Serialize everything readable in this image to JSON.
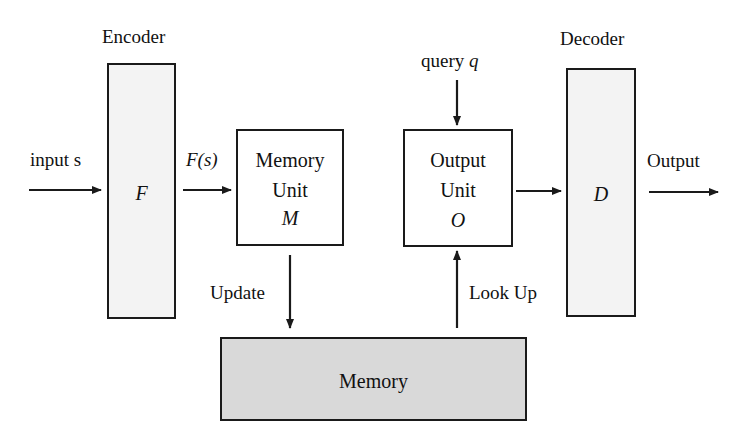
{
  "diagram": {
    "encoder": {
      "title": "Encoder",
      "symbol": "F"
    },
    "input": {
      "label": "input s"
    },
    "encoded": {
      "label": "F(s)"
    },
    "memory_unit": {
      "line1": "Memory",
      "line2": "Unit",
      "symbol": "M"
    },
    "update": {
      "label": "Update"
    },
    "memory": {
      "label": "Memory"
    },
    "query": {
      "label": "query",
      "symbol": "q"
    },
    "output_unit": {
      "line1": "Output",
      "line2": "Unit",
      "symbol": "O"
    },
    "lookup": {
      "label": "Look Up"
    },
    "decoder": {
      "title": "Decoder",
      "symbol": "D"
    },
    "output": {
      "label": "Output"
    }
  },
  "colors": {
    "stroke": "#1a1a1a",
    "encoder_fill": "#f3f3f3",
    "decoder_fill": "#f3f3f3",
    "memory_fill": "#d9d9d9",
    "unit_fill": "#ffffff"
  }
}
